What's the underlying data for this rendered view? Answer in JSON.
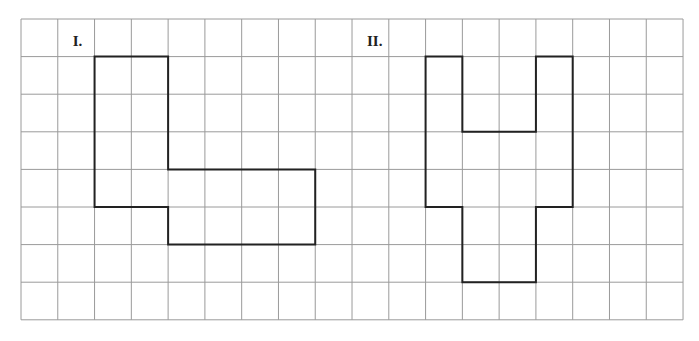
{
  "grid": {
    "origin_x": 21,
    "origin_y": 19,
    "cell_w": 36.78,
    "cell_h": 37.6,
    "cols": 18,
    "rows": 8,
    "line_color": "#9a9a9a",
    "shape_color": "#222222"
  },
  "figures": [
    {
      "label": "I.",
      "label_col": 1,
      "label_row": 0,
      "outline": [
        [
          2,
          1
        ],
        [
          4,
          1
        ],
        [
          4,
          4
        ],
        [
          8,
          4
        ],
        [
          8,
          6
        ],
        [
          4,
          6
        ],
        [
          4,
          5
        ],
        [
          2,
          5
        ]
      ]
    },
    {
      "label": "II.",
      "label_col": 9,
      "label_row": 0,
      "outline": [
        [
          11,
          1
        ],
        [
          12,
          1
        ],
        [
          12,
          3
        ],
        [
          14,
          3
        ],
        [
          14,
          1
        ],
        [
          15,
          1
        ],
        [
          15,
          5
        ],
        [
          14,
          5
        ],
        [
          14,
          7
        ],
        [
          12,
          7
        ],
        [
          12,
          5
        ],
        [
          11,
          5
        ]
      ]
    }
  ]
}
